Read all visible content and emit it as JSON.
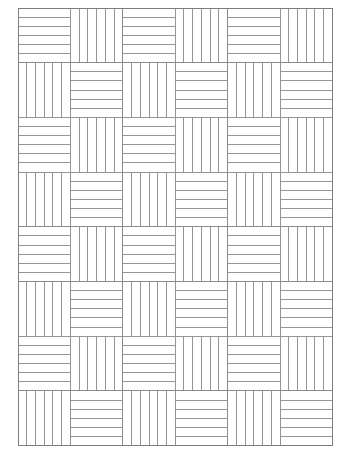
{
  "figure": {
    "kind": "diagram",
    "background_color": "#ffffff"
  },
  "canvas": {
    "width": 346,
    "height": 456
  },
  "grid": {
    "columns": 6,
    "rows": 8,
    "origin_x": 18,
    "origin_y": 8,
    "cell_width": 52.4,
    "cell_height": 54.7,
    "total_width": 314,
    "total_height": 437,
    "stripes_per_cell": 6,
    "interior_lines_per_cell": 5
  },
  "style": {
    "line_color": "#8a8a8a",
    "line_width": 0.9,
    "border_color": "#7d7d7d",
    "border_width": 1.0,
    "fill_color": "#ffffff"
  },
  "pattern": {
    "rule": "horizontal when (row + column) is even, vertical when odd",
    "orientations": [
      [
        "horizontal",
        "vertical",
        "horizontal",
        "vertical",
        "horizontal",
        "vertical"
      ],
      [
        "vertical",
        "horizontal",
        "vertical",
        "horizontal",
        "vertical",
        "horizontal"
      ],
      [
        "horizontal",
        "vertical",
        "horizontal",
        "vertical",
        "horizontal",
        "vertical"
      ],
      [
        "vertical",
        "horizontal",
        "vertical",
        "horizontal",
        "vertical",
        "horizontal"
      ],
      [
        "horizontal",
        "vertical",
        "horizontal",
        "vertical",
        "horizontal",
        "vertical"
      ],
      [
        "vertical",
        "horizontal",
        "vertical",
        "horizontal",
        "vertical",
        "horizontal"
      ],
      [
        "horizontal",
        "vertical",
        "horizontal",
        "vertical",
        "horizontal",
        "vertical"
      ],
      [
        "vertical",
        "horizontal",
        "vertical",
        "horizontal",
        "vertical",
        "horizontal"
      ]
    ]
  }
}
